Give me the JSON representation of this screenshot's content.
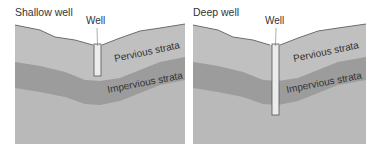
{
  "diagram": {
    "panels": [
      {
        "title": "Shallow well",
        "well_label": "Well",
        "upper_layer_label": "Pervious strata",
        "middle_layer_label": "Impervious strata",
        "well_depth": "shallow"
      },
      {
        "title": "Deep well",
        "well_label": "Well",
        "upper_layer_label": "Pervious strata",
        "middle_layer_label": "Impervious strata",
        "well_depth": "deep"
      }
    ],
    "colors": {
      "background": "#ffffff",
      "pervious": "#bdbdbd",
      "impervious": "#9e9e9e",
      "lower": "#b9b9b9",
      "well": "#ececec",
      "outline": "#555555",
      "text": "#333333"
    }
  }
}
